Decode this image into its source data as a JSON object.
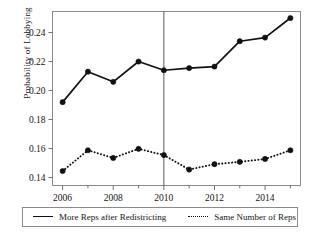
{
  "chart_data": {
    "type": "line",
    "title": "",
    "subtitle": "",
    "xlabel": "",
    "ylabel": "Probability of Lobbying",
    "x": [
      2006,
      2007,
      2008,
      2009,
      2010,
      2011,
      2012,
      2013,
      2014,
      2015
    ],
    "xlim": [
      2005.6,
      2015.4
    ],
    "ylim": [
      0.1345,
      0.2545
    ],
    "xticks": [
      2006,
      2007,
      2008,
      2009,
      2010,
      2011,
      2012,
      2013,
      2014,
      2015
    ],
    "xticklabels": [
      "2006",
      "",
      "2008",
      "",
      "2010",
      "",
      "2012",
      "",
      "2014",
      ""
    ],
    "yticks": [
      0.14,
      0.16,
      0.18,
      0.2,
      0.22,
      0.24
    ],
    "yticklabels": [
      "0.14",
      "0.16",
      "0.18",
      "0.20",
      "0.22",
      "0.24"
    ],
    "grid": false,
    "legend_position": "below-axes",
    "annotations": [
      {
        "type": "vline",
        "x": 2010,
        "label": ""
      }
    ],
    "series": [
      {
        "name": "More Reps after Redistricting",
        "style": "solid",
        "marker": "filled-circle",
        "color": "#111111",
        "values": [
          0.192,
          0.213,
          0.206,
          0.22,
          0.214,
          0.2155,
          0.2165,
          0.234,
          0.2365,
          0.25
        ]
      },
      {
        "name": "Same Number of Reps",
        "style": "dotted",
        "marker": "filled-circle",
        "color": "#111111",
        "values": [
          0.1445,
          0.1588,
          0.1535,
          0.1598,
          0.1555,
          0.1455,
          0.1492,
          0.1508,
          0.1528,
          0.1588
        ]
      }
    ]
  },
  "legend": {
    "entries": [
      {
        "label": "More Reps after Redistricting"
      },
      {
        "label": "Same Number of Reps"
      }
    ]
  },
  "axes": {
    "y_title": "Probability of Lobbying"
  },
  "caption": {
    "text": ""
  }
}
